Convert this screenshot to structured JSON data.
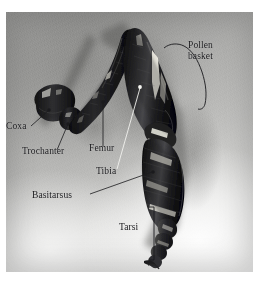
{
  "figure": {
    "kind": "photograph",
    "palette": {
      "ink": "#17171a",
      "leader_dark": "#1a1a1d",
      "leader_light": "#f2f2ee",
      "photo_light": "#ececea",
      "photo_mid": "#b9b9b7",
      "photo_dark": "#9d9d9b",
      "specimen_dark": "#151517",
      "specimen_mid": "#3a3a3c",
      "specimen_highlight": "#f0efe9"
    },
    "canvas": {
      "width": 259,
      "height": 281
    },
    "photo_frame": {
      "x": 6,
      "y": 12,
      "width": 247,
      "height": 260
    }
  },
  "labels": [
    {
      "id": "coxa",
      "text": "Coxa",
      "x": 6,
      "y": 127,
      "leader": {
        "type": "line-with-dot",
        "from": [
          31,
          126
        ],
        "to": [
          49,
          110
        ],
        "dot": [
          49,
          110
        ],
        "dot_color": "#1a1a1d"
      }
    },
    {
      "id": "trochanter",
      "text": "Trochanter",
      "x": 22,
      "y": 152,
      "leader": {
        "type": "line-with-dot",
        "from": [
          57,
          150
        ],
        "to": [
          68,
          124
        ],
        "dot": [
          68,
          124
        ],
        "dot_color": "#1a1a1d"
      }
    },
    {
      "id": "femur",
      "text": "Femur",
      "x": 89,
      "y": 150,
      "leader": {
        "type": "line-with-dot",
        "from": [
          103,
          146
        ],
        "to": [
          103,
          102
        ],
        "dot": [
          103,
          102
        ],
        "dot_color": "#1a1a1d"
      }
    },
    {
      "id": "tibia",
      "text": "Tibia",
      "x": 96,
      "y": 173,
      "leader": {
        "type": "line-with-dot",
        "from": [
          118,
          168
        ],
        "to": [
          140,
          87
        ],
        "dot": [
          140,
          87
        ],
        "dot_color": "#f2f2ee"
      }
    },
    {
      "id": "basitarsus",
      "text": "Basitarsus",
      "x": 32,
      "y": 197,
      "leader": {
        "type": "line-with-dot",
        "from": [
          90,
          194
        ],
        "to": [
          153,
          172
        ],
        "dot": [
          153,
          172
        ],
        "dot_color": "#1a1a1d"
      }
    },
    {
      "id": "tarsi",
      "text": "Tarsi",
      "x": 119,
      "y": 228,
      "leader": {
        "type": "bracket-vertical",
        "x": 154,
        "y_top": 207,
        "y_bottom": 260,
        "tick": 5
      }
    },
    {
      "id": "pollen-basket",
      "text": "Pollen\nbasket",
      "x": 188,
      "y": 46,
      "two_line": true,
      "leader": {
        "type": "bracket-curly",
        "x_left": 165,
        "x_right": 207,
        "y_top": 45,
        "y_bottom": 105
      }
    }
  ]
}
